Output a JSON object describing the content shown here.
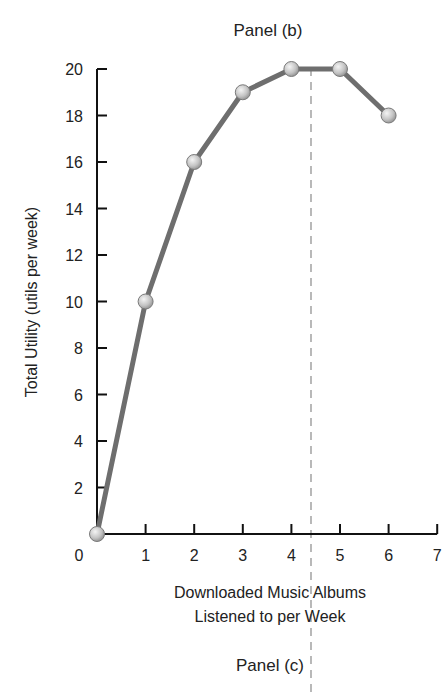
{
  "chart_data": {
    "type": "line",
    "title": "Panel (b)",
    "footer_title": "Panel (c)",
    "xlabel": "Downloaded Music Albums Listened to per Week",
    "xlabel_lines": [
      "Downloaded Music Albums",
      "Listened to per Week"
    ],
    "ylabel": "Total Utility (utils per week)",
    "x": [
      0,
      1,
      2,
      3,
      4,
      5,
      6
    ],
    "values": [
      0,
      10,
      16,
      19,
      20,
      20,
      18
    ],
    "series": [
      {
        "name": "Total Utility",
        "x": [
          0,
          1,
          2,
          3,
          4,
          5,
          6
        ],
        "values": [
          0,
          10,
          16,
          19,
          20,
          20,
          18
        ]
      }
    ],
    "xlim": [
      0,
      7
    ],
    "ylim": [
      0,
      20
    ],
    "x_ticks": [
      0,
      1,
      2,
      3,
      4,
      5,
      6,
      7
    ],
    "y_ticks": [
      2,
      4,
      6,
      8,
      10,
      12,
      14,
      16,
      18,
      20
    ],
    "annotations": [
      {
        "type": "vertical-dashed-line",
        "x": 4.5,
        "description": "marks maximum total utility between 4 and 5 albums"
      }
    ],
    "grid": false,
    "legend": "none",
    "colors": {
      "line": "#6e6e6e",
      "marker": "#c8c8c8",
      "marker_stroke": "#7a7a7a",
      "axis": "#111111",
      "dashed": "#888888"
    }
  }
}
